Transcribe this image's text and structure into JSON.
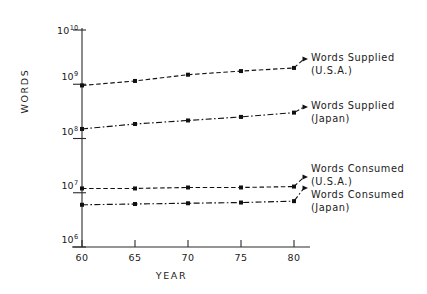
{
  "chart_data": {
    "type": "line",
    "title": "",
    "xlabel": "YEAR",
    "ylabel": "WORDS",
    "x": [
      60,
      65,
      70,
      75,
      80
    ],
    "xtick_labels": [
      "60",
      "65",
      "70",
      "75",
      "80"
    ],
    "xlim": [
      60,
      80
    ],
    "yscale": "log",
    "ylim": [
      1000000,
      10000000000
    ],
    "ytick_labels": [
      "10⁶",
      "10⁷",
      "10⁸",
      "10⁹",
      "10¹⁰"
    ],
    "yticks": [
      {
        "mantissa": "10",
        "exponent": "6",
        "value": 1000000
      },
      {
        "mantissa": "10",
        "exponent": "7",
        "value": 10000000
      },
      {
        "mantissa": "10",
        "exponent": "8",
        "value": 100000000
      },
      {
        "mantissa": "10",
        "exponent": "9",
        "value": 1000000000
      },
      {
        "mantissa": "10",
        "exponent": "10",
        "value": 10000000000
      }
    ],
    "grid": false,
    "legend_position": "right-inline-annotations",
    "series": [
      {
        "name": "Words Supplied (U.S.A.)",
        "label_line1": "Words Supplied",
        "label_line2": "(U.S.A.)",
        "linestyle": "dashed",
        "marker": "square",
        "color": "#111111",
        "values": [
          950000000,
          1150000000,
          1500000000,
          1750000000,
          2000000000
        ]
      },
      {
        "name": "Words Supplied (Japan)",
        "label_line1": "Words Supplied",
        "label_line2": "(Japan)",
        "linestyle": "dashdot",
        "marker": "square",
        "color": "#111111",
        "values": [
          150000000,
          185000000,
          215000000,
          250000000,
          300000000
        ]
      },
      {
        "name": "Words Consumed (U.S.A.)",
        "label_line1": "Words Consumed",
        "label_line2": "(U.S.A.)",
        "linestyle": "dashed",
        "marker": "square",
        "color": "#111111",
        "values": [
          12000000,
          12000000,
          12500000,
          12500000,
          13000000
        ]
      },
      {
        "name": "Words Consumed (Japan)",
        "label_line1": "Words Consumed",
        "label_line2": "(Japan)",
        "linestyle": "dashdot",
        "marker": "square",
        "color": "#111111",
        "values": [
          6000000,
          6200000,
          6400000,
          6600000,
          7000000
        ]
      }
    ]
  }
}
